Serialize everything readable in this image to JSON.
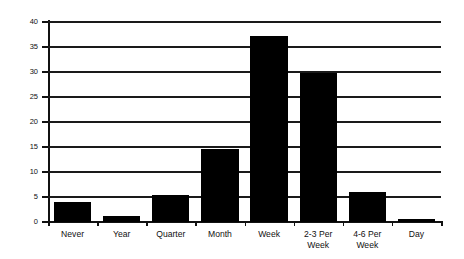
{
  "chart_data": {
    "type": "bar",
    "title": "",
    "xlabel": "",
    "ylabel": "Percent Married",
    "ylim": [
      0,
      40
    ],
    "ytick_labels": [
      "0",
      "5",
      "10",
      "15",
      "20",
      "25",
      "30",
      "35",
      "40"
    ],
    "ytick_values": [
      0,
      5,
      10,
      15,
      20,
      25,
      30,
      35,
      40
    ],
    "grid": true,
    "legend": "none",
    "categories": [
      "Never",
      "Year",
      "Quarter",
      "Month",
      "Week",
      "2-3 Per\nWeek",
      "4-6 Per\nWeek",
      "Day"
    ],
    "values": [
      4.0,
      1.3,
      5.4,
      14.6,
      37.2,
      29.8,
      6.0,
      0.7
    ],
    "bar_color": "#000000"
  }
}
